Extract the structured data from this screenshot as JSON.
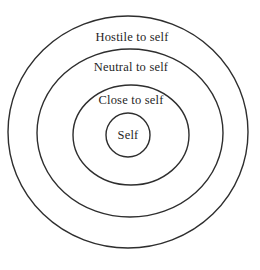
{
  "diagram": {
    "rings": [
      {
        "id": "outer",
        "label": "Hostile to self"
      },
      {
        "id": "third",
        "label": "Neutral to self"
      },
      {
        "id": "second",
        "label": "Close to self"
      },
      {
        "id": "inner",
        "label": "Self"
      }
    ],
    "colors": {
      "stroke": "#2e2e2e",
      "text": "#1f1f1f",
      "background": "#ffffff"
    }
  }
}
